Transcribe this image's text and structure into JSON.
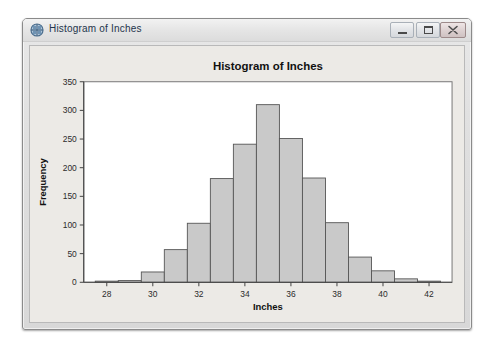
{
  "window": {
    "title": "Histogram of Inches",
    "icon": "plot-window-icon",
    "buttons": {
      "minimize": "Minimize",
      "maximize": "Maximize",
      "close": "Close"
    }
  },
  "chart_data": {
    "type": "bar",
    "title": "Histogram of Inches",
    "xlabel": "Inches",
    "ylabel": "Frequency",
    "xlim": [
      27.0,
      43.0
    ],
    "ylim": [
      0,
      350
    ],
    "xticks": [
      28,
      30,
      32,
      34,
      36,
      38,
      40,
      42
    ],
    "yticks": [
      0,
      50,
      100,
      150,
      200,
      250,
      300,
      350
    ],
    "xtick_labels": [
      "28",
      "30",
      "32",
      "34",
      "36",
      "38",
      "40",
      "42"
    ],
    "ytick_labels": [
      "0",
      "50",
      "100",
      "150",
      "200",
      "250",
      "300",
      "350"
    ],
    "grid": false,
    "legend": "none",
    "bar_width": 1,
    "bar_fill": "#c9c9c9",
    "bar_stroke": "#555555",
    "plot_background": "#ffffff",
    "figure_background": "#eceae6",
    "categories": [
      28,
      29,
      30,
      31,
      32,
      33,
      34,
      35,
      36,
      37,
      38,
      39,
      40,
      41,
      42
    ],
    "values": [
      2,
      3,
      18,
      57,
      103,
      181,
      241,
      310,
      251,
      182,
      104,
      44,
      20,
      6,
      2
    ]
  }
}
